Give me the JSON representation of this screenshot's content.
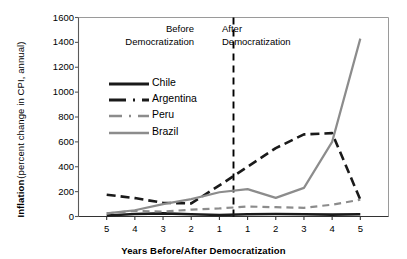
{
  "chart_data": {
    "type": "line",
    "title": "",
    "xlabel": "Years Before/After Democratization",
    "ylabel": "Inflation",
    "ylabel_sub": "(percent change in CPI, annual)",
    "ylim": [
      0,
      1600
    ],
    "yticks": [
      1600,
      1400,
      1200,
      1000,
      800,
      600,
      400,
      200,
      0
    ],
    "xticks": [
      "5",
      "4",
      "3",
      "2",
      "1",
      "1",
      "2",
      "3",
      "4",
      "5"
    ],
    "x": [
      -5,
      -4,
      -3,
      -2,
      -1,
      1,
      2,
      3,
      4,
      5
    ],
    "grid": false,
    "legend_position": "inside upper-left",
    "series": [
      {
        "name": "Chile",
        "color": "#1a1a1a",
        "style": "solid",
        "values": [
          8,
          20,
          25,
          18,
          12,
          18,
          20,
          18,
          15,
          18
        ]
      },
      {
        "name": "Argentina",
        "color": "#1a1a1a",
        "style": "dashed",
        "values": [
          175,
          148,
          110,
          105,
          250,
          400,
          550,
          660,
          670,
          135
        ]
      },
      {
        "name": "Peru",
        "color": "#8c8c8c",
        "style": "dashed",
        "values": [
          25,
          45,
          40,
          55,
          65,
          80,
          75,
          70,
          95,
          135
        ]
      },
      {
        "name": "Brazil",
        "color": "#8c8c8c",
        "style": "solid",
        "values": [
          25,
          50,
          100,
          140,
          195,
          220,
          150,
          230,
          600,
          1430
        ]
      }
    ],
    "annotations": [
      {
        "id": "before",
        "text_line1": "Before",
        "text_line2": "Democratization"
      },
      {
        "id": "after",
        "text_line1": "After",
        "text_line2": "Democratization"
      }
    ],
    "divider": {
      "x": 0,
      "style": "dashed",
      "color": "#000000"
    }
  }
}
